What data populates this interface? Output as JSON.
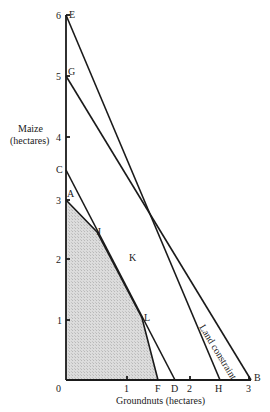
{
  "diagram": {
    "y_axis_title_line1": "Maize",
    "y_axis_title_line2": "(hectares)",
    "x_axis_title": "Groundnuts (hectares)",
    "y_ticks": [
      "0",
      "1",
      "2",
      "3",
      "4",
      "5",
      "6"
    ],
    "x_ticks": [
      "1",
      "2",
      "3"
    ],
    "points": {
      "E": "E",
      "G": "G",
      "C": "C",
      "A": "A",
      "J": "J",
      "K": "K",
      "L": "L",
      "F": "F",
      "D": "D",
      "H": "H",
      "B": "B"
    },
    "land_constraint_label": "Land constraint",
    "colors": {
      "line": "#1a1a1a",
      "shaded_region": "#d4d4d4",
      "background": "#ffffff"
    }
  }
}
